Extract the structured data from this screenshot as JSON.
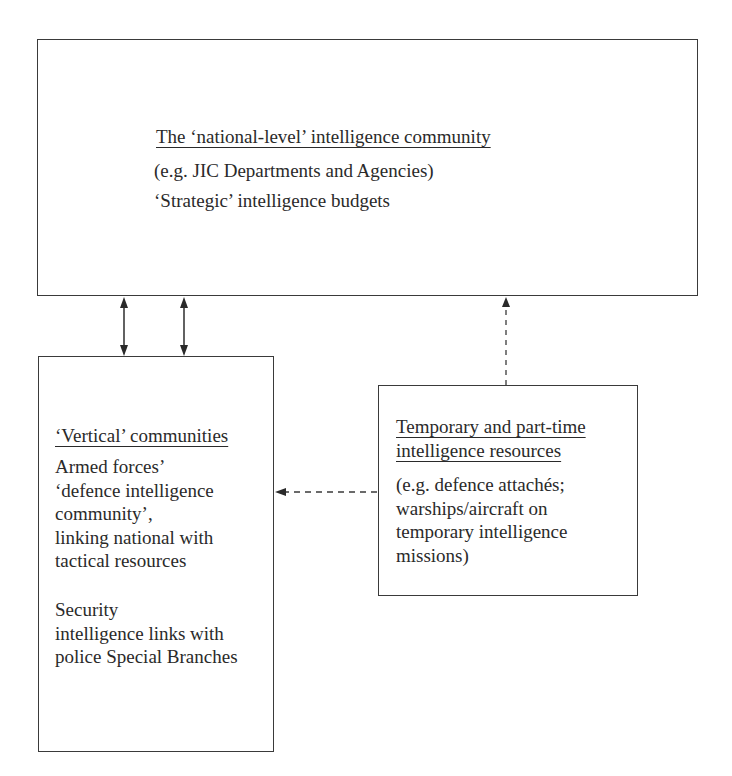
{
  "diagram": {
    "boxes": {
      "national": {
        "heading": "The ‘national-level’ intelligence community",
        "lines": [
          "(e.g. JIC Departments and Agencies)",
          "‘Strategic’ intelligence budgets"
        ]
      },
      "vertical": {
        "heading": "‘Vertical’ communities",
        "group1": [
          "Armed forces’",
          "‘defence intelligence",
          "community’,",
          "linking national with",
          "tactical resources"
        ],
        "group2": [
          "Security",
          "intelligence links with",
          "police Special Branches"
        ]
      },
      "temporary": {
        "heading_lines": [
          "Temporary and part-time",
          "intelligence resources"
        ],
        "lines": [
          "(e.g. defence attachés;",
          "warships/aircraft on",
          "temporary intelligence",
          "missions)"
        ]
      }
    },
    "connectors": [
      {
        "from": "national",
        "to": "vertical",
        "style": "solid",
        "direction": "both"
      },
      {
        "from": "national",
        "to": "vertical",
        "style": "solid",
        "direction": "both"
      },
      {
        "from": "temporary",
        "to": "national",
        "style": "dashed",
        "direction": "forward"
      },
      {
        "from": "temporary",
        "to": "vertical",
        "style": "dashed",
        "direction": "forward"
      }
    ],
    "colors": {
      "line": "#3a3a3a",
      "text": "#2a2a2a",
      "background": "#ffffff"
    }
  }
}
